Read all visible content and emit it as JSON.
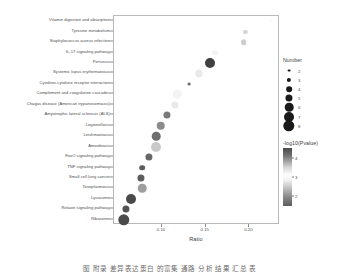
{
  "chart_data": {
    "type": "scatter",
    "title": "",
    "xlabel": "Ratio",
    "ylabel": "",
    "xlim": [
      0.045,
      0.235
    ],
    "xticks": [
      0.1,
      0.15,
      0.2
    ],
    "xtick_labels": [
      "0.10",
      "0.15",
      "0.20"
    ],
    "grid": false,
    "legend_position": "right",
    "size_legend": {
      "title": "Number",
      "values": [
        2,
        3,
        4,
        5,
        6,
        7,
        8
      ],
      "labels": [
        "2",
        "3",
        "4",
        "5",
        "6",
        "7",
        "8"
      ]
    },
    "color_legend": {
      "title": "-log10(Pvalue)",
      "ticks": [
        4,
        3,
        2
      ],
      "tick_labels": [
        "4",
        "3",
        "2"
      ],
      "min": 2,
      "max": 4,
      "colormap": "grayscale"
    },
    "categories": [
      "Vitamin digestion and absorption",
      "Tyrosine metabolism",
      "Staphylococcus aureus infection",
      "IL-17 signaling pathway",
      "Pertussis",
      "Systemic lupus erythematosus",
      "Cytokine-cytokine receptor interaction",
      "Complement and coagulation cascades",
      "Chagas disease (American trypanosomiasis)",
      "Amyotrophic lateral sclerosis (ALS)",
      "Legionellosis",
      "Leishmaniasis",
      "Amoebiasis",
      "FoxO signaling pathway",
      "TNF signaling pathway",
      "Small cell lung cancer",
      "Toxoplasmosis",
      "Lysosome",
      "Relaxin signaling pathway",
      "Ribosome"
    ],
    "points": [
      {
        "label": "Vitamin digestion and absorption",
        "ratio": 0.2255,
        "number": 2,
        "pvalue_log": 3.05
      },
      {
        "label": "Tyrosine metabolism",
        "ratio": 0.1955,
        "number": 3,
        "pvalue_log": 2.85
      },
      {
        "label": "Staphylococcus aureus infection",
        "ratio": 0.1935,
        "number": 4,
        "pvalue_log": 2.8
      },
      {
        "label": "IL-17 signaling pathway",
        "ratio": 0.161,
        "number": 4,
        "pvalue_log": 3.0
      },
      {
        "label": "Pertussis",
        "ratio": 0.155,
        "number": 7,
        "pvalue_log": 2.05
      },
      {
        "label": "Systemic lupus erythematosus",
        "ratio": 0.1425,
        "number": 5,
        "pvalue_log": 2.95
      },
      {
        "label": "Cytokine-cytokine receptor interaction",
        "ratio": 0.131,
        "number": 2,
        "pvalue_log": 2.3
      },
      {
        "label": "Complement and coagulation cascades",
        "ratio": 0.1175,
        "number": 6,
        "pvalue_log": 3.0
      },
      {
        "label": "Chagas disease (American trypanosomiasis)",
        "ratio": 0.1145,
        "number": 5,
        "pvalue_log": 2.95
      },
      {
        "label": "Amyotrophic lateral sclerosis (ALS)",
        "ratio": 0.106,
        "number": 5,
        "pvalue_log": 2.35
      },
      {
        "label": "Legionellosis",
        "ratio": 0.0985,
        "number": 6,
        "pvalue_log": 2.45
      },
      {
        "label": "Leishmaniasis",
        "ratio": 0.0935,
        "number": 6,
        "pvalue_log": 2.3
      },
      {
        "label": "Amoebiasis",
        "ratio": 0.093,
        "number": 7,
        "pvalue_log": 3.3
      },
      {
        "label": "FoxO signaling pathway",
        "ratio": 0.0855,
        "number": 5,
        "pvalue_log": 2.25
      },
      {
        "label": "TNF signaling pathway",
        "ratio": 0.077,
        "number": 4,
        "pvalue_log": 2.2
      },
      {
        "label": "Small cell lung cancer",
        "ratio": 0.0755,
        "number": 5,
        "pvalue_log": 2.2
      },
      {
        "label": "Toxoplasmosis",
        "ratio": 0.0775,
        "number": 6,
        "pvalue_log": 2.55
      },
      {
        "label": "Lysosome",
        "ratio": 0.064,
        "number": 7,
        "pvalue_log": 2.1
      },
      {
        "label": "Relaxin signaling pathway",
        "ratio": 0.0585,
        "number": 5,
        "pvalue_log": 2.15
      },
      {
        "label": "Ribosome",
        "ratio": 0.056,
        "number": 8,
        "pvalue_log": 2.1
      }
    ]
  },
  "caption": {
    "text": "图  附录  差异表达蛋白  的富集  通路  分析  结果  汇总  表"
  }
}
